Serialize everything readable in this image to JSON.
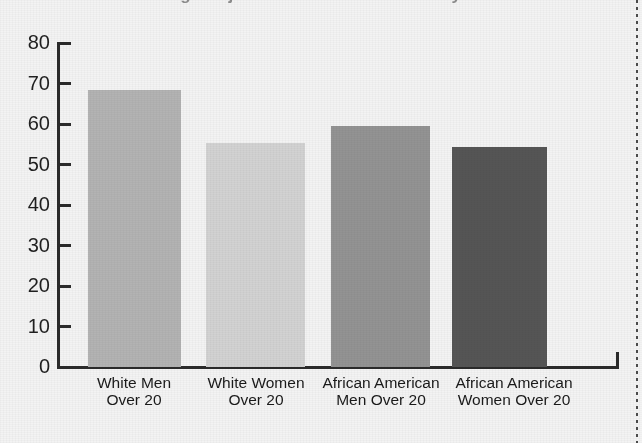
{
  "figure": {
    "cropped_title": "Age-Adjusted Prevalence of Obesity",
    "background_color": "#f3f3f3",
    "axis_color": "#2b2b2b",
    "page_edge_artifact": "dotted-page-edge"
  },
  "chart_data": {
    "type": "bar",
    "title": "",
    "xlabel": "",
    "ylabel": "",
    "ylim": [
      0,
      80
    ],
    "yticks": [
      0,
      10,
      20,
      30,
      40,
      50,
      60,
      70,
      80
    ],
    "grid": false,
    "legend": null,
    "categories": [
      "White Men\nOver 20",
      "White Women\nOver 20",
      "African American\nMen Over 20",
      "African American\nWomen Over 20"
    ],
    "values": [
      68.5,
      55.2,
      59.4,
      54.2
    ],
    "bar_colors": [
      "#b3b3b3",
      "#d2d2d2",
      "#939393",
      "#555555"
    ]
  }
}
